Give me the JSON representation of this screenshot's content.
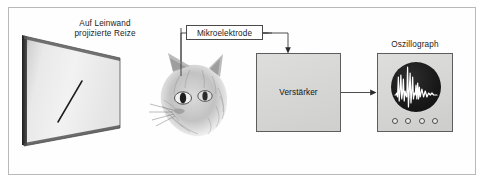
{
  "figure": {
    "language": "de",
    "frame_border_color": "#b9b9b9",
    "background_color": "#ffffff"
  },
  "screen": {
    "label": "Auf Leinwand\nprojizierte Reize",
    "label_line_1": "Auf Leinwand",
    "label_line_2": "projizierte Reize",
    "stimulus": "diagonal-bar",
    "fill_light": "#f2f2f2",
    "fill_dark": "#8f8f8f",
    "edge_color": "#2a2a2a"
  },
  "electrode": {
    "label": "Mikroelektrode",
    "box_border_color": "#4a4a4a",
    "lead_color": "#3a3a3a"
  },
  "animal": {
    "name": "cat-head",
    "label": "",
    "ink_color": "#6b6b6b"
  },
  "amplifier": {
    "label": "Verstärker",
    "fill": "#d8d8d7",
    "border_color": "#5d5d5d"
  },
  "oscillograph": {
    "label": "Oszillograph",
    "fill": "#d8d8d7",
    "border_color": "#5d5d5d",
    "screen_color": "#1a1a1a",
    "trace_color": "#ffffff",
    "knob_count": 4,
    "knobs": [
      "knob-1",
      "knob-2",
      "knob-3",
      "knob-4"
    ]
  },
  "connections": [
    {
      "name": "electrode-to-cat",
      "from": "Mikroelektrode",
      "to": "cat-head",
      "arrow": false
    },
    {
      "name": "electrode-to-amplifier",
      "from": "Mikroelektrode",
      "to": "Verstärker",
      "arrow": true
    },
    {
      "name": "amplifier-to-oscillograph",
      "from": "Verstärker",
      "to": "Oszillograph",
      "arrow": true
    }
  ],
  "chart_data": {
    "type": "line",
    "xlabel": "",
    "ylabel": "",
    "series": [
      {
        "name": "neuronale Aktivität",
        "x": [
          0,
          2,
          4,
          6,
          8,
          10,
          12,
          14,
          16,
          18,
          20,
          22,
          24,
          26,
          28,
          30,
          32,
          34,
          36,
          38,
          40,
          42,
          44,
          46,
          48,
          50,
          52,
          54,
          56,
          58,
          60,
          64,
          68,
          72,
          76,
          80,
          84,
          88,
          92,
          100
        ],
        "values": [
          0,
          0,
          1,
          -1,
          9,
          -3,
          2,
          10,
          -2,
          1,
          8,
          -3,
          2,
          0,
          -1,
          14,
          -6,
          2,
          11,
          -4,
          1,
          9,
          -2,
          1,
          0,
          5,
          -2,
          6,
          -2,
          4,
          -1,
          3,
          -1,
          2,
          -1,
          1,
          0,
          1,
          0,
          0
        ]
      }
    ],
    "grid": false,
    "legend": false
  }
}
